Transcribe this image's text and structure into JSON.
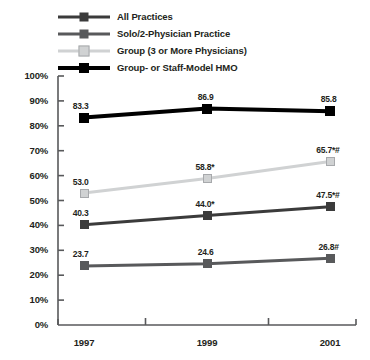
{
  "chart_data": {
    "type": "line",
    "title": "",
    "subtitle": "",
    "xlabel": "",
    "ylabel": "",
    "categories": [
      "1997",
      "1999",
      "2001"
    ],
    "x": [
      1997,
      1999,
      2001
    ],
    "ylim": [
      0,
      100
    ],
    "ytick_labels": [
      "100%",
      "90%",
      "80%",
      "70%",
      "60%",
      "50%",
      "40%",
      "30%",
      "20%",
      "10%",
      "0%"
    ],
    "ytick_values": [
      100,
      90,
      80,
      70,
      60,
      50,
      40,
      30,
      20,
      10,
      0
    ],
    "grid": false,
    "legend_position": "top-left",
    "series": [
      {
        "name": "All Practices",
        "color": "#3b3b3b",
        "line_width": 3,
        "marker": "square",
        "marker_size": 9,
        "values": [
          40.3,
          44.0,
          47.5
        ],
        "labels": [
          "40.3",
          "44.0*",
          "47.5*#"
        ]
      },
      {
        "name": "Solo/2-Physician Practice",
        "color": "#58595b",
        "line_width": 3,
        "marker": "square",
        "marker_size": 9,
        "values": [
          23.7,
          24.6,
          26.8
        ],
        "labels": [
          "23.7",
          "24.6",
          "26.8#"
        ]
      },
      {
        "name": "Group (3 or More Physicians)",
        "color": "#d0d2d3",
        "line_width": 3,
        "marker": "square",
        "marker_size": 9,
        "values": [
          53.0,
          58.8,
          65.7
        ],
        "labels": [
          "53.0",
          "58.8*",
          "65.7*#"
        ]
      },
      {
        "name": "Group- or Staff-Model HMO",
        "color": "#000000",
        "line_width": 4,
        "marker": "square",
        "marker_size": 10,
        "values": [
          83.3,
          86.9,
          85.8
        ],
        "labels": [
          "83.3",
          "86.9",
          "85.8"
        ]
      }
    ]
  },
  "legend": {
    "items": [
      {
        "label": "All Practices"
      },
      {
        "label": "Solo/2-Physician Practice"
      },
      {
        "label": "Group (3 or More Physicians)"
      },
      {
        "label": "Group- or Staff-Model HMO"
      }
    ]
  },
  "axes": {
    "axis_color": "#58595b"
  }
}
